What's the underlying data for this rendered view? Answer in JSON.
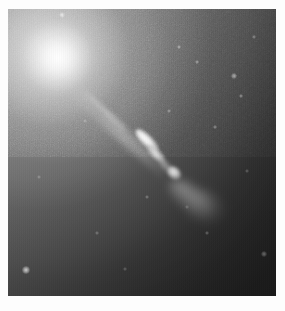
{
  "page": {
    "background_color": "#fdfdfd",
    "width": 285,
    "height": 311
  },
  "image": {
    "kind": "astronomical-photograph",
    "subject": "elliptical-galaxy-with-relativistic-jet",
    "palette": "grayscale",
    "frame": {
      "left": 8,
      "top": 9,
      "width": 268,
      "height": 287
    },
    "background_color": "#2b2b2b",
    "highlight_color": "#ffffff",
    "midtone_color": "#6f6f6f",
    "shadow_color": "#262626"
  },
  "features": {
    "nucleus": {
      "name": "galaxy-core",
      "center_x": 50,
      "center_y": 49,
      "peak_color": "#ffffff",
      "halo_extent": 150
    },
    "jet": {
      "name": "relativistic-jet",
      "origin_x": 64,
      "origin_y": 74,
      "position_angle_deg": 42,
      "length": 130,
      "knots": [
        {
          "label": "knot-a",
          "x": 124,
          "y": 126,
          "w": 30,
          "h": 11,
          "angle": 44,
          "brightness": 1.0
        },
        {
          "label": "knot-a2",
          "x": 136,
          "y": 140,
          "w": 24,
          "h": 10,
          "angle": 44,
          "brightness": 0.94
        },
        {
          "label": "knot-bridge",
          "x": 148,
          "y": 152,
          "w": 18,
          "h": 8,
          "angle": 45,
          "brightness": 0.72
        },
        {
          "label": "knot-b",
          "x": 158,
          "y": 158,
          "w": 16,
          "h": 12,
          "angle": 40,
          "brightness": 0.98
        }
      ],
      "terminal_lobe": {
        "x": 163,
        "y": 168,
        "w": 54,
        "h": 26,
        "angle": 38,
        "brightness": 0.52
      }
    },
    "point_sources": [
      {
        "x": 24,
        "y": 268,
        "size": 4,
        "brightness": 0.95
      },
      {
        "x": 60,
        "y": 13,
        "size": 3,
        "brightness": 0.7
      },
      {
        "x": 178,
        "y": 46,
        "size": 2,
        "brightness": 0.5
      },
      {
        "x": 196,
        "y": 61,
        "size": 2,
        "brightness": 0.45
      },
      {
        "x": 232,
        "y": 74,
        "size": 3,
        "brightness": 0.62
      },
      {
        "x": 240,
        "y": 95,
        "size": 2,
        "brightness": 0.48
      },
      {
        "x": 253,
        "y": 36,
        "size": 2,
        "brightness": 0.42
      },
      {
        "x": 214,
        "y": 126,
        "size": 2,
        "brightness": 0.44
      },
      {
        "x": 168,
        "y": 110,
        "size": 2,
        "brightness": 0.4
      },
      {
        "x": 146,
        "y": 196,
        "size": 2,
        "brightness": 0.38
      },
      {
        "x": 206,
        "y": 232,
        "size": 2,
        "brightness": 0.4
      },
      {
        "x": 262,
        "y": 252,
        "size": 3,
        "brightness": 0.55
      },
      {
        "x": 96,
        "y": 232,
        "size": 2,
        "brightness": 0.35
      },
      {
        "x": 124,
        "y": 268,
        "size": 2,
        "brightness": 0.33
      },
      {
        "x": 38,
        "y": 176,
        "size": 2,
        "brightness": 0.3
      },
      {
        "x": 84,
        "y": 120,
        "size": 2,
        "brightness": 0.32
      },
      {
        "x": 186,
        "y": 206,
        "size": 2,
        "brightness": 0.3
      },
      {
        "x": 246,
        "y": 170,
        "size": 2,
        "brightness": 0.34
      }
    ]
  }
}
